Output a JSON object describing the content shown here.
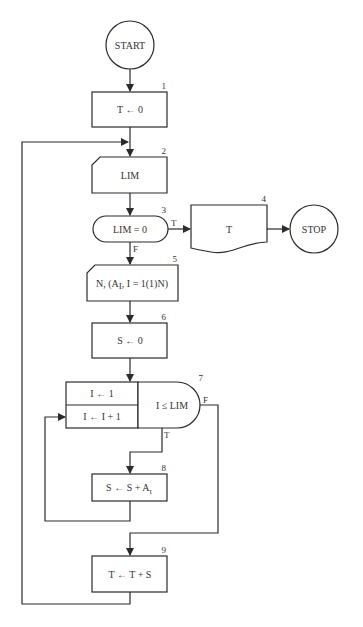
{
  "diagram": {
    "type": "flowchart",
    "start": {
      "label": "START"
    },
    "stop": {
      "label": "STOP"
    },
    "nodes": [
      {
        "id": 1,
        "number": "1",
        "shape": "process",
        "label": "T ← 0"
      },
      {
        "id": 2,
        "number": "2",
        "shape": "punched-card-input",
        "label": "LIM"
      },
      {
        "id": 3,
        "number": "3",
        "shape": "decision-terminal",
        "label": "LIM = 0",
        "true_label": "T",
        "false_label": "F"
      },
      {
        "id": 4,
        "number": "4",
        "shape": "document-output",
        "label": "T"
      },
      {
        "id": 5,
        "number": "5",
        "shape": "punched-card-input",
        "label_main": "N, (A",
        "label_sub": "I",
        "label_rest": ", I = 1(1)N)"
      },
      {
        "id": 6,
        "number": "6",
        "shape": "process",
        "label": "S ← 0"
      },
      {
        "id": 7,
        "number": "7",
        "shape": "loop",
        "init": "I ← 1",
        "increment": "I ← I + 1",
        "test": "I ≤ LIM",
        "true_label": "T",
        "false_label": "F"
      },
      {
        "id": 8,
        "number": "8",
        "shape": "process",
        "label_main": "S ← S + A",
        "label_sub": "I"
      },
      {
        "id": 9,
        "number": "9",
        "shape": "process",
        "label": "T ← T + S"
      }
    ],
    "edges": [
      {
        "from": "START",
        "to": 1
      },
      {
        "from": 1,
        "to": 2
      },
      {
        "from": 2,
        "to": 3
      },
      {
        "from": 3,
        "to": 4,
        "label": "T"
      },
      {
        "from": 4,
        "to": "STOP"
      },
      {
        "from": 3,
        "to": 5,
        "label": "F"
      },
      {
        "from": 5,
        "to": 6
      },
      {
        "from": 6,
        "to": 7
      },
      {
        "from": 7,
        "to": 8,
        "label": "T"
      },
      {
        "from": 8,
        "to": 7,
        "note": "loop back to increment"
      },
      {
        "from": 7,
        "to": 9,
        "label": "F"
      },
      {
        "from": 9,
        "to": 2,
        "note": "loop back to LIM input"
      }
    ]
  }
}
